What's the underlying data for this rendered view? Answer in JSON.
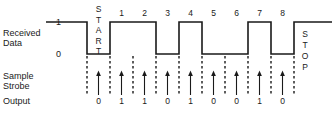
{
  "figure": {
    "line_color": "#1a1a1a",
    "background": "#ffffff"
  },
  "rows": {
    "received_data": {
      "label_line1": "Received",
      "label_line2": "Data",
      "level_high_label": "1",
      "level_low_label": "0"
    },
    "sample_strobe": {
      "label_line1": "Sample",
      "label_line2": "Strobe"
    },
    "output": {
      "label": "Output"
    }
  },
  "frame": {
    "start_bit_label": "START",
    "stop_bit_label": "STOP",
    "data_bit_labels": [
      "1",
      "2",
      "3",
      "4",
      "5",
      "6",
      "7",
      "8"
    ],
    "output_values": [
      "0",
      "1",
      "1",
      "0",
      "1",
      "0",
      "0",
      "1",
      "0"
    ]
  },
  "chart_data": {
    "type": "line",
    "xlabel": "",
    "ylabel": "Received Data",
    "ylim": [
      0,
      1
    ],
    "grid": false,
    "legend": "none",
    "bit_period_px": 23,
    "signals": [
      {
        "name": "Received Data",
        "type": "digital-waveform",
        "idle_level": 1,
        "bits": [
          {
            "name": "idle",
            "level": 1,
            "x_start": 46,
            "x_end": 87
          },
          {
            "name": "START",
            "level": 0,
            "x_start": 87,
            "x_end": 110
          },
          {
            "name": "1",
            "level": 1,
            "x_start": 110,
            "x_end": 133
          },
          {
            "name": "2",
            "level": 1,
            "x_start": 133,
            "x_end": 156
          },
          {
            "name": "3",
            "level": 0,
            "x_start": 156,
            "x_end": 179
          },
          {
            "name": "4",
            "level": 1,
            "x_start": 179,
            "x_end": 202
          },
          {
            "name": "5",
            "level": 0,
            "x_start": 202,
            "x_end": 225
          },
          {
            "name": "6",
            "level": 0,
            "x_start": 225,
            "x_end": 248
          },
          {
            "name": "7",
            "level": 1,
            "x_start": 248,
            "x_end": 271
          },
          {
            "name": "8",
            "level": 0,
            "x_start": 271,
            "x_end": 294
          },
          {
            "name": "STOP",
            "level": 1,
            "x_start": 294,
            "x_end": 332
          }
        ]
      },
      {
        "name": "Sample Strobe",
        "type": "impulse",
        "sample_centers_px": [
          98.5,
          121.5,
          144.5,
          167.5,
          190.5,
          213.5,
          236.5,
          259.5,
          282.5
        ],
        "sampled_bits": [
          "START",
          "1",
          "2",
          "3",
          "4",
          "5",
          "6",
          "7",
          "8"
        ],
        "sampled_values": [
          0,
          1,
          1,
          0,
          1,
          0,
          0,
          1,
          0
        ]
      },
      {
        "name": "Output",
        "type": "annotation",
        "values": [
          0,
          1,
          1,
          0,
          1,
          0,
          0,
          1,
          0
        ]
      }
    ],
    "bit_boundaries_px": [
      87,
      110,
      133,
      156,
      179,
      202,
      225,
      248,
      271,
      294
    ]
  }
}
